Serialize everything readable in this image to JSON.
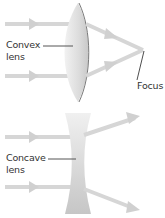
{
  "diagram": {
    "convex": {
      "label_line1": "Convex",
      "label_line2": "lens",
      "focus_label": "Focus"
    },
    "concave": {
      "label_line1": "Concave",
      "label_line2": "lens"
    }
  },
  "colors": {
    "ray": "#d6d6d6",
    "lens_light": "#ededed",
    "lens_dark": "#c4c4c4",
    "lens_edge": "#6e6e6e",
    "pointer": "#3a3a3a",
    "text": "#333333"
  }
}
